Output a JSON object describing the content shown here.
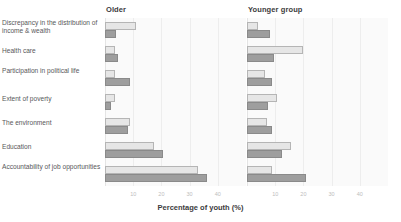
{
  "chart_data": {
    "type": "bar",
    "orientation": "horizontal",
    "title": "",
    "xlabel": "Percentage of youth (%)",
    "ylabel": "",
    "xlim": [
      0,
      50
    ],
    "xticks": [
      10,
      20,
      30,
      40
    ],
    "xtick_labels": [
      "10",
      "20",
      "30",
      "40"
    ],
    "grid": true,
    "legend_position": "top-right",
    "categories": [
      "Discrepancy in the distribution of income & wealth",
      "Health care",
      "Participation in political life",
      "Extent of poverty",
      "The environment",
      "Education",
      "Accountability of job opportunities"
    ],
    "panels": [
      {
        "name": "Older",
        "series": [
          {
            "name": "Male",
            "values": [
              11.0,
              3.5,
              3.5,
              3.5,
              9.0,
              17.5,
              33.0
            ]
          },
          {
            "name": "Female",
            "values": [
              4.0,
              4.5,
              9.0,
              2.0,
              8.0,
              20.5,
              36.0
            ]
          }
        ]
      },
      {
        "name": "Younger group",
        "values_note": "",
        "series": [
          {
            "name": "Male",
            "values": [
              4.0,
              20.0,
              6.5,
              10.5,
              7.0,
              15.5,
              9.0
            ]
          },
          {
            "name": "Female",
            "values": [
              8.0,
              9.5,
              9.0,
              7.5,
              9.0,
              12.5,
              21.0
            ]
          }
        ]
      }
    ],
    "legend": [
      {
        "label": "Male",
        "color": "#e6e6e6"
      },
      {
        "label": "Female",
        "color": "#9e9e9e"
      }
    ]
  },
  "panel_titles": {
    "older": "Older",
    "younger": "Younger group"
  },
  "axis": {
    "title": "Percentage of youth (%)"
  },
  "colors": {
    "male": "#e6e6e6",
    "female": "#9e9e9e",
    "plot_background": "#fafafa",
    "gridline": "#ededed",
    "text": "#58585a",
    "heading": "#3b3b3d",
    "tick_text": "#bdbdbd"
  }
}
